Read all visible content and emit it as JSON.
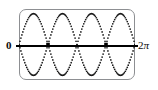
{
  "figure": {
    "kind": "graphing-calculator-screen",
    "frame": {
      "style": "rounded-rectangle",
      "border_color": "#8d8f92",
      "background_color": "#ffffff"
    },
    "axis": {
      "orientation": "horizontal",
      "color": "#000000",
      "left_label": "0",
      "right_label": "2π",
      "right_label_number": "2",
      "right_label_symbol": "π"
    },
    "curve": {
      "render": "dotted",
      "dot_color": "#1a1a1a",
      "dot_radius": 0.85,
      "marked_point_color": "#000000"
    }
  },
  "chart_data": {
    "type": "scatter",
    "title": "",
    "xlabel": "",
    "ylabel": "",
    "xlim": [
      0,
      6.283185
    ],
    "ylim": [
      -1.15,
      1.15
    ],
    "xtick_labels": [
      "0",
      "2π"
    ],
    "xtick_values": [
      0,
      6.283185
    ],
    "grid": false,
    "legend": false,
    "series": [
      {
        "name": "upper",
        "expression": "y = |sin(2x)|",
        "style": "dotted",
        "n_humps": 4,
        "peak_value": 1.0,
        "peak_x": [
          0.7854,
          2.3562,
          3.927,
          5.4978
        ],
        "zero_x": [
          0,
          1.5708,
          3.1416,
          4.7124,
          6.283185
        ]
      },
      {
        "name": "lower",
        "expression": "y = -|sin(2x)|",
        "style": "dotted",
        "n_humps": 4,
        "peak_value": -1.0,
        "peak_x": [
          0.7854,
          2.3562,
          3.927,
          5.4978
        ],
        "zero_x": [
          0,
          1.5708,
          3.1416,
          4.7124,
          6.283185
        ]
      }
    ],
    "marked_points": [
      {
        "x": 1.5708,
        "y": 0
      },
      {
        "x": 4.7124,
        "y": 0
      }
    ]
  }
}
